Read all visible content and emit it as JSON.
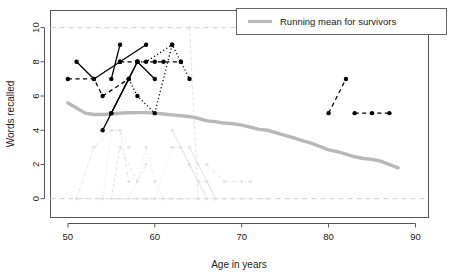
{
  "chart_data": {
    "type": "line",
    "title": "",
    "xlabel": "Age in years",
    "ylabel": "Words recalled",
    "xlim": [
      48.0,
      91.5
    ],
    "ylim": [
      -1.1,
      11.0
    ],
    "xticks": [
      50,
      60,
      70,
      80,
      90
    ],
    "yticks": [
      0,
      2,
      4,
      6,
      8,
      10
    ],
    "grid": false,
    "legend": {
      "position": "top-right",
      "entries": [
        {
          "label": "Running mean for survivors",
          "color": "#b3b3b3",
          "style": "solid-thick"
        }
      ]
    },
    "reference_lines": [
      {
        "y": 10,
        "style": "dashed",
        "color": "#d9d9d9"
      },
      {
        "y": 0,
        "style": "dashed",
        "color": "#d9d9d9"
      }
    ],
    "series": [
      {
        "name": "running-mean-survivors",
        "group": "running-mean",
        "color": "#b8b8b8",
        "style": "solid-thick",
        "x": [
          50,
          51,
          52,
          53,
          54,
          55,
          56,
          57,
          58,
          59,
          60,
          61,
          62,
          63,
          64,
          65,
          66,
          67,
          68,
          69,
          70,
          71,
          72,
          73,
          74,
          75,
          76,
          77,
          78,
          79,
          80,
          81,
          82,
          83,
          84,
          85,
          86,
          87,
          88
        ],
        "y": [
          5.6,
          5.3,
          5.0,
          4.92,
          4.92,
          4.95,
          5.0,
          5.02,
          5.03,
          5.03,
          5.0,
          4.95,
          4.9,
          4.85,
          4.8,
          4.7,
          4.55,
          4.5,
          4.42,
          4.38,
          4.3,
          4.18,
          4.05,
          4.0,
          3.85,
          3.7,
          3.55,
          3.4,
          3.25,
          3.05,
          2.85,
          2.75,
          2.6,
          2.45,
          2.35,
          2.3,
          2.2,
          2.0,
          1.8
        ]
      },
      {
        "name": "survivor-1",
        "group": "survivor",
        "color": "#000000",
        "style": "solid",
        "x": [
          51,
          53,
          56,
          59
        ],
        "y": [
          8,
          7,
          8,
          9
        ]
      },
      {
        "name": "survivor-2",
        "group": "survivor",
        "color": "#000000",
        "style": "dashed",
        "x": [
          50,
          53,
          54,
          57
        ],
        "y": [
          7,
          7,
          6,
          7
        ]
      },
      {
        "name": "survivor-3",
        "group": "survivor",
        "color": "#000000",
        "style": "solid",
        "x": [
          54,
          55,
          58
        ],
        "y": [
          4,
          5,
          8
        ]
      },
      {
        "name": "survivor-4",
        "group": "survivor",
        "color": "#000000",
        "style": "solid",
        "x": [
          55,
          56
        ],
        "y": [
          7,
          9
        ]
      },
      {
        "name": "survivor-5",
        "group": "survivor",
        "color": "#000000",
        "style": "solid",
        "x": [
          55,
          57,
          58,
          60
        ],
        "y": [
          5,
          7,
          8,
          7
        ]
      },
      {
        "name": "survivor-6",
        "group": "survivor",
        "color": "#000000",
        "style": "dashed",
        "x": [
          56,
          58,
          60,
          61,
          63
        ],
        "y": [
          8,
          8,
          8,
          8,
          8
        ]
      },
      {
        "name": "survivor-7",
        "group": "survivor",
        "color": "#000000",
        "style": "dotted",
        "x": [
          57,
          58,
          60,
          62,
          63,
          64
        ],
        "y": [
          7,
          6,
          5,
          9,
          8,
          7
        ]
      },
      {
        "name": "survivor-8",
        "group": "survivor",
        "color": "#000000",
        "style": "dotted",
        "x": [
          58,
          59,
          62
        ],
        "y": [
          8,
          8,
          9
        ]
      },
      {
        "name": "survivor-9",
        "group": "survivor",
        "color": "#000000",
        "style": "dashed",
        "x": [
          80,
          82
        ],
        "y": [
          5,
          7
        ]
      },
      {
        "name": "survivor-10",
        "group": "survivor",
        "color": "#000000",
        "style": "dashed",
        "x": [
          83,
          85,
          87
        ],
        "y": [
          5,
          5,
          5
        ]
      },
      {
        "name": "deceased-1",
        "group": "deceased",
        "color": "#e2e2e2",
        "style": "dashdot",
        "x": [
          51,
          53,
          55,
          56,
          57
        ],
        "y": [
          0,
          3,
          4,
          4,
          1
        ]
      },
      {
        "name": "deceased-2",
        "group": "deceased",
        "color": "#e2e2e2",
        "style": "dotted",
        "x": [
          54,
          55,
          56,
          57
        ],
        "y": [
          0,
          4,
          4,
          3
        ]
      },
      {
        "name": "deceased-3",
        "group": "deceased",
        "color": "#e2e2e2",
        "style": "dashed",
        "x": [
          55,
          56,
          58,
          59
        ],
        "y": [
          0,
          3,
          1,
          2
        ]
      },
      {
        "name": "deceased-4",
        "group": "deceased",
        "color": "#e2e2e2",
        "style": "dotted",
        "x": [
          57,
          58,
          59,
          60,
          61
        ],
        "y": [
          0,
          1,
          3,
          1,
          0
        ]
      },
      {
        "name": "deceased-5",
        "group": "deceased",
        "color": "#e2e2e2",
        "style": "dotted",
        "x": [
          59,
          60,
          62,
          63
        ],
        "y": [
          0,
          0,
          3,
          3
        ]
      },
      {
        "name": "deceased-6",
        "group": "deceased",
        "color": "#e2e2e2",
        "style": "solid",
        "x": [
          62,
          63,
          64,
          65,
          66
        ],
        "y": [
          4,
          3,
          2,
          1,
          0
        ]
      },
      {
        "name": "deceased-7",
        "group": "deceased",
        "color": "#e2e2e2",
        "style": "dashed",
        "x": [
          62,
          63,
          64,
          65,
          66,
          67
        ],
        "y": [
          3,
          3,
          2,
          1,
          1,
          0
        ]
      },
      {
        "name": "deceased-8",
        "group": "deceased",
        "color": "#e2e2e2",
        "style": "solid",
        "x": [
          64,
          65,
          66,
          67
        ],
        "y": [
          3,
          2,
          1,
          0
        ]
      },
      {
        "name": "deceased-9",
        "group": "deceased",
        "color": "#e2e2e2",
        "style": "dashdot",
        "x": [
          66,
          68,
          70,
          71
        ],
        "y": [
          2,
          1,
          1,
          1
        ]
      },
      {
        "name": "deceased-10",
        "group": "deceased",
        "color": "#e2e2e2",
        "style": "dashed",
        "x": [
          64,
          65
        ],
        "y": [
          10,
          0
        ]
      },
      {
        "name": "deceased-baseline",
        "group": "deceased",
        "color": "#e2e2e2",
        "style": "dashed",
        "x": [
          51,
          54,
          56,
          58,
          59,
          60,
          61,
          62,
          63,
          65,
          66,
          67,
          68,
          69,
          70,
          71,
          73
        ],
        "y": [
          0,
          0,
          0,
          0,
          0,
          0,
          0,
          0,
          0,
          0,
          0,
          0,
          0,
          0,
          0,
          0,
          0
        ]
      }
    ]
  }
}
